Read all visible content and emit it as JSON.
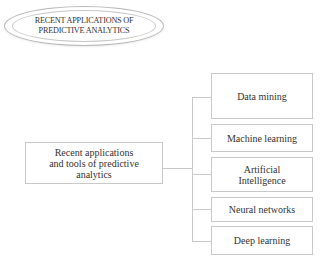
{
  "title": {
    "line1": "RECENT APPLICATIONS OF",
    "line2": "PREDICTIVE ANALYTICS"
  },
  "root": {
    "line1": "Recent applications",
    "line2": "and tools of predictive",
    "line3": "analytics"
  },
  "children": [
    {
      "label": "Data mining"
    },
    {
      "label": "Machine learning"
    },
    {
      "label_line1": "Artificial",
      "label_line2": "Intelligence"
    },
    {
      "label": "Neural networks"
    },
    {
      "label": "Deep learning"
    }
  ]
}
